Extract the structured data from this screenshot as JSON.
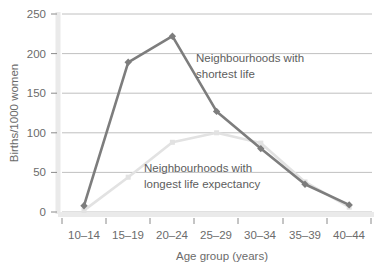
{
  "chart_data": {
    "type": "line",
    "title": "",
    "xlabel": "Age group (years)",
    "ylabel": "Births/1000 women",
    "categories": [
      "10–14",
      "15–19",
      "20–24",
      "25–29",
      "30–34",
      "35–39",
      "40–44"
    ],
    "yticks": [
      "0",
      "50",
      "100",
      "150",
      "200",
      "250"
    ],
    "ytick_values": [
      0,
      50,
      100,
      150,
      200,
      250
    ],
    "ylim": [
      0,
      250
    ],
    "grid": "horizontal",
    "legend_position": "inline-annotations",
    "series": [
      {
        "name": "Neighbourhoods with shortest life",
        "color": "#7d7d7d",
        "marker": "diamond",
        "values": [
          8,
          189,
          222,
          127,
          80,
          35,
          9
        ]
      },
      {
        "name": "Neighbourhoods with longest life expectancy",
        "color": "#e2e2e2",
        "marker": "square",
        "values": [
          2,
          44,
          88,
          100,
          87,
          38,
          6
        ]
      }
    ],
    "annotations": [
      {
        "name": "annotation-shortest-life",
        "line1": "Neighbourhoods with",
        "line2": "shortest life",
        "x": 196,
        "y": 57
      },
      {
        "name": "annotation-longest-life",
        "line1": "Neighbourhoods with",
        "line2": "longest life expectancy",
        "x": 144,
        "y": 167
      }
    ]
  },
  "colors": {
    "series_dark": "#7d7d7d",
    "series_light": "#e2e2e2",
    "grid": "#b9b9b9",
    "axis": "#e8e8e8",
    "text": "#6b6b6b",
    "background": "#ffffff"
  },
  "axis_labels": {
    "y_axis_title": "Births/1000 women",
    "x_axis_title": "Age group (years)"
  }
}
